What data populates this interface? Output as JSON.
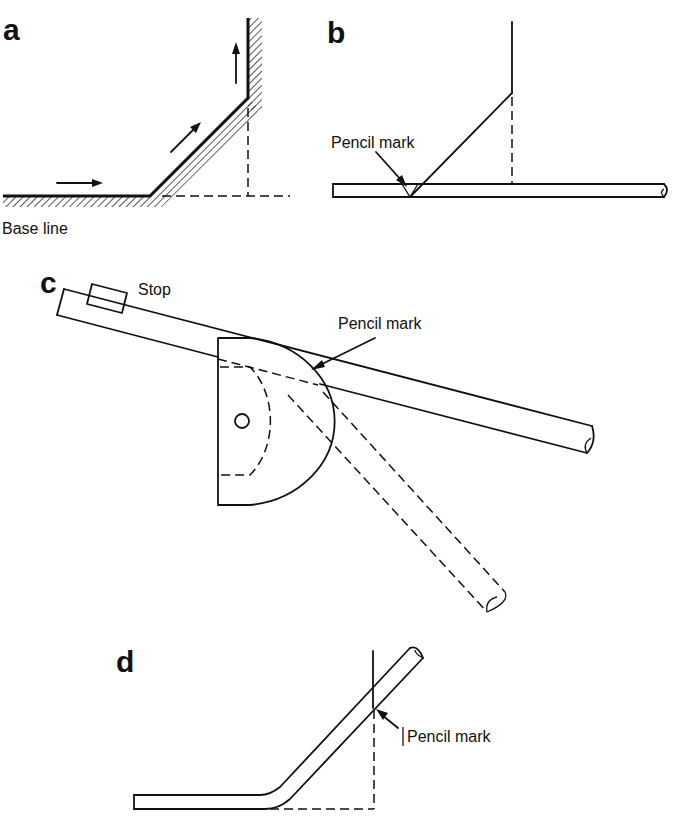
{
  "diagram": {
    "panels": [
      {
        "id": "a",
        "letter": "a",
        "labels": {
          "base_line": "Base line"
        },
        "elements": [
          "hatched base line",
          "45-degree hatched offset",
          "vertical hatched wall",
          "direction arrows",
          "dashed construction lines"
        ]
      },
      {
        "id": "b",
        "letter": "b",
        "labels": {
          "pencil_mark": "Pencil mark"
        },
        "elements": [
          "pipe on base line",
          "angled set-out line",
          "vertical line",
          "dashed projection"
        ]
      },
      {
        "id": "c",
        "letter": "c",
        "labels": {
          "stop": "Stop",
          "pencil_mark": "Pencil mark"
        },
        "elements": [
          "pipe in bender",
          "stop block",
          "former (semicircular)",
          "pivot hole",
          "dashed bent pipe position"
        ]
      },
      {
        "id": "d",
        "letter": "d",
        "labels": {
          "pencil_mark": "Pencil mark"
        },
        "elements": [
          "bent pipe",
          "vertical check line",
          "dashed construction lines"
        ]
      }
    ],
    "colors": {
      "ink": "#111111",
      "background": "#ffffff"
    }
  }
}
